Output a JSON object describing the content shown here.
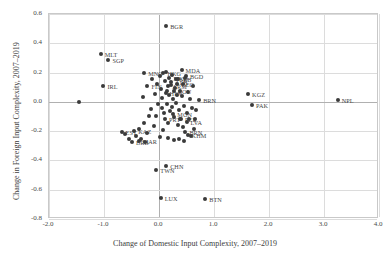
{
  "chart_data": {
    "type": "scatter",
    "title": "",
    "xlabel": "Change of Domestic Input Complexity, 2007–2019",
    "ylabel": "Change in Foreign Input Complexity, 2007–2019",
    "xlim": [
      -2.0,
      4.0
    ],
    "ylim": [
      -0.8,
      0.6
    ],
    "xticks": [
      "-2.0",
      "-1.0",
      "0.0",
      "1.0",
      "2.0",
      "3.0",
      "4.0"
    ],
    "xtick_values": [
      -2.0,
      -1.0,
      0.0,
      1.0,
      2.0,
      3.0,
      4.0
    ],
    "yticks": [
      "0.6",
      "0.4",
      "0.2",
      "0.0",
      "-0.2",
      "-0.4",
      "-0.6",
      "-0.8"
    ],
    "ytick_values": [
      0.6,
      0.4,
      0.2,
      0.0,
      -0.2,
      -0.4,
      -0.6,
      -0.8
    ],
    "grid": true,
    "legend": "none",
    "marker_color": "#3a3a3a",
    "points": [
      {
        "label": "BGR",
        "x": 0.13,
        "y": 0.52,
        "dx": 4,
        "dy": 0
      },
      {
        "label": "MLT",
        "x": -1.06,
        "y": 0.33,
        "dx": 4,
        "dy": 0
      },
      {
        "label": "SGP",
        "x": -0.92,
        "y": 0.285,
        "dx": 4,
        "dy": 0
      },
      {
        "label": "MNG",
        "x": -0.27,
        "y": 0.2,
        "dx": 4,
        "dy": 0
      },
      {
        "label": "IRL",
        "x": -1.01,
        "y": 0.11,
        "dx": 4,
        "dy": 0
      },
      {
        "label": "FIN",
        "x": -0.21,
        "y": 0.105,
        "dx": 4,
        "dy": 0
      },
      {
        "label": "HKG",
        "x": 0.08,
        "y": 0.195,
        "dx": 4,
        "dy": 0
      },
      {
        "label": "MDA",
        "x": 0.41,
        "y": 0.215,
        "dx": 4,
        "dy": 0
      },
      {
        "label": "BGD",
        "x": 0.49,
        "y": 0.175,
        "dx": 4,
        "dy": 0
      },
      {
        "label": "MKD",
        "x": 0.19,
        "y": 0.165,
        "dx": 4,
        "dy": 0
      },
      {
        "label": "SRB",
        "x": 0.3,
        "y": 0.155,
        "dx": 4,
        "dy": 0
      },
      {
        "label": "ALB",
        "x": 0.22,
        "y": 0.135,
        "dx": 4,
        "dy": 0
      },
      {
        "label": "GEO",
        "x": 0.33,
        "y": 0.125,
        "dx": 4,
        "dy": 0
      },
      {
        "label": "ARM",
        "x": 0.17,
        "y": 0.105,
        "dx": 4,
        "dy": 0
      },
      {
        "label": "ROU",
        "x": 0.27,
        "y": 0.075,
        "dx": 4,
        "dy": 0
      },
      {
        "label": "HRV",
        "x": 0.12,
        "y": 0.06,
        "dx": 4,
        "dy": 0
      },
      {
        "label": "BRN",
        "x": 0.73,
        "y": 0.015,
        "dx": 4,
        "dy": 0
      },
      {
        "label": "KGZ",
        "x": 1.62,
        "y": 0.055,
        "dx": 4,
        "dy": 0
      },
      {
        "label": "PAK",
        "x": 1.69,
        "y": -0.02,
        "dx": 4,
        "dy": 0
      },
      {
        "label": "NPL",
        "x": 3.25,
        "y": 0.01,
        "dx": 4,
        "dy": 0
      },
      {
        "label": "EST",
        "x": -0.68,
        "y": -0.205,
        "dx": 4,
        "dy": 0
      },
      {
        "label": "KAZ",
        "x": -0.45,
        "y": -0.2,
        "dx": 4,
        "dy": 0
      },
      {
        "label": "LVA",
        "x": 0.5,
        "y": -0.135,
        "dx": 4,
        "dy": 0
      },
      {
        "label": "PRT",
        "x": 0.11,
        "y": -0.12,
        "dx": 4,
        "dy": 0
      },
      {
        "label": "PER",
        "x": 0.4,
        "y": -0.115,
        "dx": 4,
        "dy": 0
      },
      {
        "label": "MON",
        "x": 0.26,
        "y": -0.085,
        "dx": 4,
        "dy": 0
      },
      {
        "label": "BRB",
        "x": -0.49,
        "y": -0.275,
        "dx": 4,
        "dy": 0
      },
      {
        "label": "MAR",
        "x": -0.37,
        "y": -0.27,
        "dx": 4,
        "dy": 0
      },
      {
        "label": "BRN2",
        "x": 0.48,
        "y": -0.205,
        "dx": 4,
        "dy": 0
      },
      {
        "label": "KHM",
        "x": 0.52,
        "y": -0.225,
        "dx": 4,
        "dy": 0
      },
      {
        "label": "TWN",
        "x": -0.05,
        "y": -0.465,
        "dx": 4,
        "dy": 0
      },
      {
        "label": "CHN",
        "x": 0.13,
        "y": -0.435,
        "dx": 4,
        "dy": 0
      },
      {
        "label": "LUX",
        "x": 0.03,
        "y": -0.655,
        "dx": 4,
        "dy": 0
      },
      {
        "label": "BTN",
        "x": 0.84,
        "y": -0.66,
        "dx": 4,
        "dy": 0
      }
    ],
    "unlabeled_points": [
      [
        -1.45,
        0.0
      ],
      [
        -0.3,
        0.035
      ],
      [
        -0.12,
        0.155
      ],
      [
        -0.03,
        0.125
      ],
      [
        -0.08,
        0.055
      ],
      [
        -0.02,
        -0.015
      ],
      [
        -0.14,
        -0.05
      ],
      [
        -0.06,
        -0.095
      ],
      [
        0.02,
        0.175
      ],
      [
        0.03,
        0.09
      ],
      [
        0.05,
        0.025
      ],
      [
        0.06,
        -0.04
      ],
      [
        0.09,
        -0.075
      ],
      [
        0.1,
        0.145
      ],
      [
        0.12,
        0.205
      ],
      [
        0.14,
        0.075
      ],
      [
        0.15,
        -0.015
      ],
      [
        0.16,
        -0.145
      ],
      [
        0.18,
        0.045
      ],
      [
        0.2,
        -0.06
      ],
      [
        0.21,
        0.115
      ],
      [
        0.23,
        -0.035
      ],
      [
        0.24,
        0.185
      ],
      [
        0.25,
        0.02
      ],
      [
        0.28,
        -0.105
      ],
      [
        0.29,
        0.095
      ],
      [
        0.31,
        -0.01
      ],
      [
        0.32,
        0.045
      ],
      [
        0.34,
        -0.155
      ],
      [
        0.35,
        0.155
      ],
      [
        0.36,
        -0.055
      ],
      [
        0.38,
        0.075
      ],
      [
        0.39,
        -0.12
      ],
      [
        0.42,
        0.04
      ],
      [
        0.43,
        -0.175
      ],
      [
        0.44,
        0.125
      ],
      [
        0.45,
        -0.03
      ],
      [
        0.47,
        0.165
      ],
      [
        0.51,
        -0.075
      ],
      [
        0.53,
        0.065
      ],
      [
        0.55,
        -0.115
      ],
      [
        0.57,
        0.02
      ],
      [
        0.6,
        -0.04
      ],
      [
        0.62,
        0.105
      ],
      [
        -0.36,
        -0.185
      ],
      [
        -0.28,
        -0.145
      ],
      [
        -0.22,
        -0.21
      ],
      [
        -0.18,
        -0.095
      ],
      [
        -0.1,
        -0.165
      ],
      [
        -0.42,
        -0.235
      ],
      [
        -0.33,
        -0.255
      ],
      [
        -0.25,
        -0.275
      ],
      [
        0.01,
        -0.24
      ],
      [
        0.07,
        -0.195
      ],
      [
        0.17,
        -0.245
      ],
      [
        0.27,
        -0.26
      ],
      [
        0.37,
        -0.255
      ],
      [
        0.46,
        -0.27
      ],
      [
        0.58,
        -0.23
      ],
      [
        0.64,
        -0.185
      ],
      [
        -0.55,
        -0.255
      ],
      [
        -0.62,
        -0.22
      ],
      [
        0.66,
        -0.12
      ],
      [
        0.68,
        -0.055
      ]
    ]
  }
}
